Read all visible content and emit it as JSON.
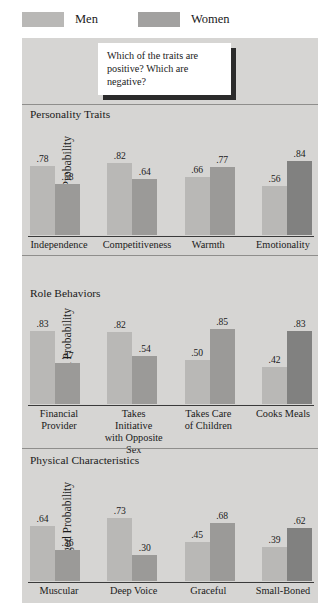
{
  "legend": {
    "items": [
      {
        "label": "Men",
        "color": "#b9b8b6",
        "icon": "legend-swatch"
      },
      {
        "label": "Women",
        "color": "#a2a1a0",
        "icon": "legend-swatch"
      }
    ]
  },
  "callout": {
    "text": "Which of the traits are positive? Which are negative?"
  },
  "axis_title": "Judged Probability",
  "chart_data": [
    {
      "type": "bar",
      "title": "Personality Traits",
      "xlabel": "",
      "ylabel": "Judged Probability",
      "ylim": [
        0,
        1
      ],
      "grid": false,
      "legend_position": "top",
      "categories": [
        "Independence",
        "Competitiveness",
        "Warmth",
        "Emotionality"
      ],
      "series": [
        {
          "name": "Men",
          "values": [
            0.78,
            0.82,
            0.66,
            0.56
          ],
          "labels": [
            ".78",
            ".82",
            ".66",
            ".56"
          ]
        },
        {
          "name": "Women",
          "values": [
            0.58,
            0.64,
            0.77,
            0.84
          ],
          "labels": [
            ".58",
            ".64",
            ".77",
            ".84"
          ]
        }
      ]
    },
    {
      "type": "bar",
      "title": "Role Behaviors",
      "xlabel": "",
      "ylabel": "Judged Probability",
      "ylim": [
        0,
        1
      ],
      "grid": false,
      "legend_position": "top",
      "categories": [
        "Financial\nProvider",
        "Takes Initiative\nwith Opposite\nSex",
        "Takes Care\nof Children",
        "Cooks Meals"
      ],
      "series": [
        {
          "name": "Men",
          "values": [
            0.83,
            0.82,
            0.5,
            0.42
          ],
          "labels": [
            ".83",
            ".82",
            ".50",
            ".42"
          ]
        },
        {
          "name": "Women",
          "values": [
            0.47,
            0.54,
            0.85,
            0.83
          ],
          "labels": [
            ".47",
            ".54",
            ".85",
            ".83"
          ]
        }
      ]
    },
    {
      "type": "bar",
      "title": "Physical Characteristics",
      "xlabel": "",
      "ylabel": "Judged Probability",
      "ylim": [
        0,
        1
      ],
      "grid": false,
      "legend_position": "top",
      "categories": [
        "Muscular",
        "Deep Voice",
        "Graceful",
        "Small-Boned"
      ],
      "series": [
        {
          "name": "Men",
          "values": [
            0.64,
            0.73,
            0.45,
            0.39
          ],
          "labels": [
            ".64",
            ".73",
            ".45",
            ".39"
          ]
        },
        {
          "name": "Women",
          "values": [
            0.36,
            0.3,
            0.68,
            0.62
          ],
          "labels": [
            ".36",
            ".30",
            ".68",
            ".62"
          ]
        }
      ]
    }
  ],
  "colors": {
    "men_bar": "#b9b8b6",
    "women_bar": "#9b9a98",
    "women_bar_dark": "#818180",
    "panel_bg": "#d6d5d3",
    "axis": "#3a3a3a",
    "text": "#1a1a1a"
  }
}
